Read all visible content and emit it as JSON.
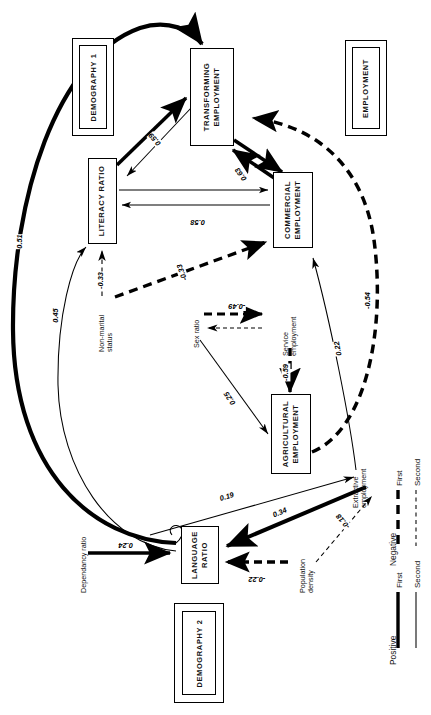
{
  "diagram": {
    "orientation": "rotated-90"
  },
  "groups": [
    {
      "id": "demography1",
      "label": "DEMOGRAPHY 1"
    },
    {
      "id": "employment",
      "label": "EMPLOYMENT"
    },
    {
      "id": "demography2",
      "label": "DEMOGRAPHY 2"
    }
  ],
  "nodes": [
    {
      "id": "transforming",
      "label": "TRANSFORMING\nEMPLOYMENT",
      "line1": "TRANSFORMING",
      "line2": "EMPLOYMENT",
      "boxed": true
    },
    {
      "id": "commercial",
      "label": "COMMERCIAL\nEMPLOYMENT",
      "line1": "COMMERCIAL",
      "line2": "EMPLOYMENT",
      "boxed": true
    },
    {
      "id": "agricultural",
      "label": "AGRICULTURAL\nEMPLOYMENT",
      "line1": "AGRICULTURAL",
      "line2": "EMPLOYMENT",
      "boxed": true
    },
    {
      "id": "literacy",
      "label": "LITERACY RATIO",
      "line1": "LITERACY RATIO",
      "line2": "",
      "boxed": true
    },
    {
      "id": "language",
      "label": "LANGUAGE\nRATIO",
      "line1": "LANGUAGE",
      "line2": "RATIO",
      "boxed": true
    },
    {
      "id": "nonmarital",
      "line1": "Non-marital",
      "line2": "status",
      "boxed": false
    },
    {
      "id": "sexratio",
      "line1": "Sex ratio",
      "line2": "",
      "boxed": false
    },
    {
      "id": "service",
      "line1": "Service",
      "line2": "employment",
      "boxed": false
    },
    {
      "id": "extractive",
      "line1": "Extractive",
      "line2": "employment",
      "boxed": false
    },
    {
      "id": "dependancy",
      "line1": "Dependancy ratio",
      "line2": "",
      "boxed": false
    },
    {
      "id": "popdensity",
      "line1": "Population",
      "line2": "density",
      "boxed": false
    }
  ],
  "edges": [
    {
      "id": "e_lang_transf",
      "from": "language",
      "to": "transforming",
      "coef": "0.51",
      "sign": "positive",
      "order": "first"
    },
    {
      "id": "e_lang_literacy",
      "from": "language",
      "to": "literacy",
      "coef": "0.45",
      "sign": "positive",
      "order": "second"
    },
    {
      "id": "e_literacy_transf",
      "from": "literacy",
      "to": "transforming",
      "coef": "0.59",
      "sign": "positive",
      "order": "first"
    },
    {
      "id": "e_transf_commercial",
      "from": "transforming",
      "to": "commercial",
      "coef": "0.63",
      "sign": "positive",
      "order": "first"
    },
    {
      "id": "e_literacy_commercial",
      "from": "literacy",
      "to": "commercial",
      "coef": "0.58",
      "sign": "positive",
      "order": "second"
    },
    {
      "id": "e_nonmar_literacy",
      "from": "nonmarital",
      "to": "literacy",
      "coef": "-0.33",
      "sign": "negative",
      "order": "second"
    },
    {
      "id": "e_nonmar_commercial",
      "from": "nonmarital",
      "to": "commercial",
      "coef": "-0.33",
      "sign": "negative",
      "order": "first"
    },
    {
      "id": "e_sex_service",
      "from": "sexratio",
      "to": "service",
      "coef": "-0.49",
      "sign": "negative",
      "order": "first"
    },
    {
      "id": "e_sex_agri",
      "from": "sexratio",
      "to": "agricultural",
      "coef": "0.25",
      "sign": "positive",
      "order": "second"
    },
    {
      "id": "e_service_agri",
      "from": "service",
      "to": "agricultural",
      "coef": "-0.59",
      "sign": "negative",
      "order": "first"
    },
    {
      "id": "e_agri_transf",
      "from": "agricultural",
      "to": "transforming",
      "coef": "-0.54",
      "sign": "negative",
      "order": "first"
    },
    {
      "id": "e_extr_commercial",
      "from": "extractive",
      "to": "commercial",
      "coef": "0.22",
      "sign": "positive",
      "order": "second"
    },
    {
      "id": "e_lang_extractive",
      "from": "language",
      "to": "extractive",
      "coef": "0.19",
      "sign": "positive",
      "order": "second"
    },
    {
      "id": "e_extr_language",
      "from": "extractive",
      "to": "language",
      "coef": "0.34",
      "sign": "positive",
      "order": "first"
    },
    {
      "id": "e_pop_extractive",
      "from": "popdensity",
      "to": "extractive",
      "coef": "-0.18",
      "sign": "negative",
      "order": "second"
    },
    {
      "id": "e_dep_language",
      "from": "dependancy",
      "to": "language",
      "coef": "0.24",
      "sign": "positive",
      "order": "first"
    },
    {
      "id": "e_pop_language",
      "from": "popdensity",
      "to": "language",
      "coef": "-0.22",
      "sign": "negative",
      "order": "first"
    }
  ],
  "coefficients": {
    "c051": "0.51",
    "c045": "0.45",
    "c059a": "0.59",
    "c063": "0.63",
    "c058": "0.58",
    "c033a": "-0.33",
    "c033b": "-0.33",
    "c049": "-0.49",
    "c025": "0.25",
    "c059b": "-0.59",
    "c054": "-0.54",
    "c022a": "0.22",
    "c019": "0.19",
    "c034": "0.34",
    "c018": "-0.18",
    "c024": "0.24",
    "c022b": "-0.22"
  },
  "legend": {
    "positive": {
      "title": "Positive",
      "first": "First",
      "second": "Second"
    },
    "negative": {
      "title": "Negative",
      "first": "First",
      "second": "Second"
    }
  },
  "colors": {
    "stroke": "#000000",
    "background": "#ffffff"
  }
}
